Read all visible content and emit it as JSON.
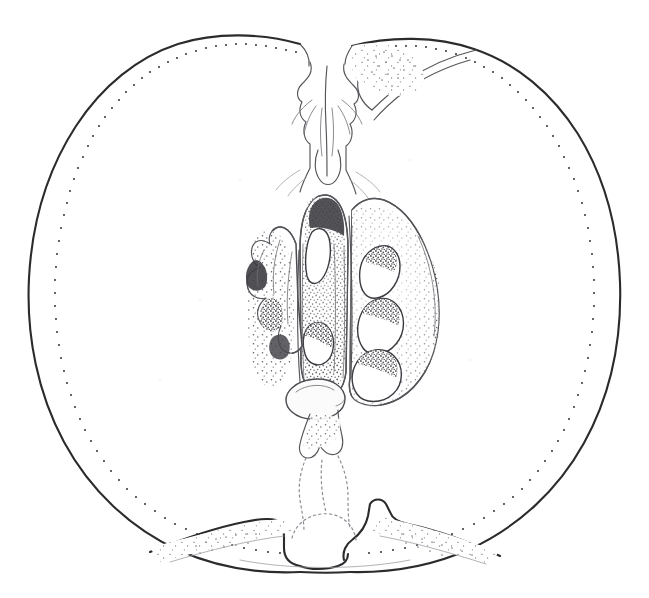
{
  "image": {
    "title": "Fruit longitudinal section — pen-and-ink stipple illustration",
    "subject": "apple-quince-fruit-cross-section",
    "technique": "stipple-and-line-engraving",
    "width_px": 649,
    "height_px": 598,
    "background_color": "#ffffff",
    "ink_color": "#2b2b2d",
    "stipple_color": "#55555a",
    "faint_line_color": "#9a9aa0"
  },
  "composition": {
    "outer_flesh_label": "fruit flesh (mesocarp) — unshaded white",
    "skin_label": "skin outline with inner stipple band",
    "core_label": "central core with seed chambers",
    "stem_cavity_label": "stem cavity and calyx remnant at apex",
    "basin_label": "calyx basin at base"
  },
  "parts": [
    {
      "id": "skin-outline",
      "name": "fruit skin outline",
      "description": "closed ovoid contour with shoulder notch at stem end"
    },
    {
      "id": "stipple-band",
      "name": "inner stipple band",
      "description": "dotted line following skin just inside the outline"
    },
    {
      "id": "stem-cavity",
      "name": "stem cavity",
      "description": "depression at apex with overhanging lip and calyx remnant"
    },
    {
      "id": "calyx-remnant",
      "name": "calyx remnant",
      "description": "dried sepal structure hanging into stem cavity"
    },
    {
      "id": "core-body",
      "name": "core body",
      "description": "stippled carpel mass containing seed chambers"
    },
    {
      "id": "locule-right-upper",
      "name": "seed chamber right upper",
      "description": "teardrop cavity"
    },
    {
      "id": "locule-right-middle",
      "name": "seed chamber right middle",
      "description": "teardrop cavity"
    },
    {
      "id": "locule-right-lower",
      "name": "seed chamber right lower",
      "description": "teardrop cavity"
    },
    {
      "id": "locule-center-upper",
      "name": "seed chamber center upper",
      "description": "narrow elongate cavity"
    },
    {
      "id": "locule-center-lower",
      "name": "seed chamber center lower",
      "description": "rounded cavity"
    },
    {
      "id": "locule-left",
      "name": "seed chamber left",
      "description": "irregular cavity in left carpel wing"
    },
    {
      "id": "seed-basal",
      "name": "basal seed",
      "description": "pale oval seed below the core"
    },
    {
      "id": "vascular-strand",
      "name": "vascular strand",
      "description": "dotted line running from core to basin"
    },
    {
      "id": "calyx-basin",
      "name": "calyx basin",
      "description": "shallow bowl at the base of the fruit"
    }
  ],
  "stipple": {
    "outline_dot_count": 340,
    "core_dot_count": 2600,
    "dot_radius_px": 1.0
  },
  "caption": ""
}
